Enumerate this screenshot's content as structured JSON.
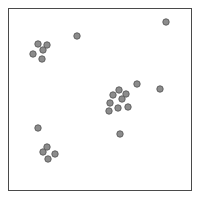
{
  "figure": {
    "kind": "scatter-plot",
    "background_color": "#ffffff",
    "frame": {
      "x": 8,
      "y": 8,
      "width": 184,
      "height": 183,
      "border_color": "#4a4a4a",
      "border_width": 1
    },
    "marker": {
      "shape": "circle",
      "radius": 3.2,
      "fill_color": "#8c8c8c",
      "stroke_color": "#5a5a5a",
      "stroke_width": 0.9
    }
  },
  "chart_data": {
    "type": "scatter",
    "title": "",
    "xlabel": "",
    "ylabel": "",
    "xlim": [
      8,
      192
    ],
    "ylim": [
      8,
      191
    ],
    "grid": false,
    "legend": null,
    "tick_labels": {
      "x": [],
      "y": []
    },
    "point_count": 23,
    "series": [
      {
        "name": "points",
        "marker_color": "#8c8c8c",
        "points": [
          {
            "x": 166,
            "y": 22
          },
          {
            "x": 77,
            "y": 36
          },
          {
            "x": 38,
            "y": 44
          },
          {
            "x": 47,
            "y": 45
          },
          {
            "x": 43,
            "y": 50
          },
          {
            "x": 33,
            "y": 54
          },
          {
            "x": 42,
            "y": 59
          },
          {
            "x": 137,
            "y": 84
          },
          {
            "x": 119,
            "y": 90
          },
          {
            "x": 113,
            "y": 95
          },
          {
            "x": 126,
            "y": 94
          },
          {
            "x": 122,
            "y": 99
          },
          {
            "x": 110,
            "y": 103
          },
          {
            "x": 118,
            "y": 108
          },
          {
            "x": 128,
            "y": 107
          },
          {
            "x": 109,
            "y": 111
          },
          {
            "x": 120,
            "y": 134
          },
          {
            "x": 38,
            "y": 128
          },
          {
            "x": 47,
            "y": 147
          },
          {
            "x": 43,
            "y": 152
          },
          {
            "x": 55,
            "y": 154
          },
          {
            "x": 48,
            "y": 159
          },
          {
            "x": 160,
            "y": 89
          }
        ]
      }
    ]
  }
}
